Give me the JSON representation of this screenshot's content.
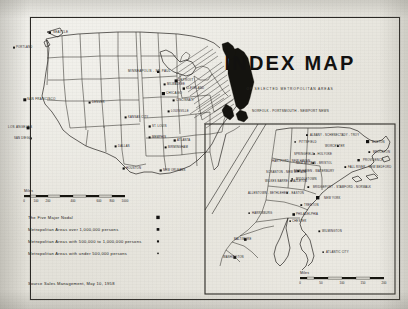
{
  "document": {
    "title": "INDEX MAP",
    "subtitle": "OF SELECTED METROPOLITAN AREAS",
    "source": "Source   Sales Management, May 10, 1958"
  },
  "legend": {
    "items": [
      {
        "label": "The Five Major Nodal",
        "marker": "square-xlarge"
      },
      {
        "label": "Metropolitan Areas over 1,000,000 persons",
        "marker": "square-large"
      },
      {
        "label": "Metropolitan Areas with  500,000 to 1,000,000 persons",
        "marker": "square-medium"
      },
      {
        "label": "Metropolitan Areas with under 500,000 persons",
        "marker": "square-small"
      }
    ]
  },
  "main_map": {
    "scale": {
      "label": "Miles",
      "ticks": [
        "0",
        "100",
        "200",
        "400",
        "600",
        "800",
        "1000"
      ]
    },
    "cities": [
      {
        "name": "SEATTLE",
        "x": 53,
        "y": 33,
        "anchor": "start",
        "size": 3
      },
      {
        "name": "PORTLAND",
        "x": 16,
        "y": 48,
        "anchor": "start",
        "size": 2
      },
      {
        "name": "SAN FRANCISCO",
        "x": 27,
        "y": 100,
        "anchor": "start",
        "size": 3
      },
      {
        "name": "LOS ANGELES",
        "x": 8,
        "y": 128,
        "anchor": "start",
        "size": 3
      },
      {
        "name": "SAN DIEGO",
        "x": 14,
        "y": 139,
        "anchor": "start",
        "size": 2
      },
      {
        "name": "DENVER",
        "x": 92,
        "y": 103,
        "anchor": "start",
        "size": 2
      },
      {
        "name": "MINNEAPOLIS - ST. PAUL",
        "x": 128,
        "y": 72,
        "anchor": "start",
        "size": 3
      },
      {
        "name": "MILWAUKEE",
        "x": 167,
        "y": 85,
        "anchor": "start",
        "size": 2
      },
      {
        "name": "CHICAGO",
        "x": 166,
        "y": 94,
        "anchor": "start",
        "size": 3
      },
      {
        "name": "KANSAS CITY",
        "x": 128,
        "y": 118,
        "anchor": "start",
        "size": 2
      },
      {
        "name": "ST. LOUIS",
        "x": 152,
        "y": 127,
        "anchor": "start",
        "size": 2
      },
      {
        "name": "DETROIT",
        "x": 178,
        "y": 81,
        "anchor": "start",
        "size": 3
      },
      {
        "name": "CLEVELAND",
        "x": 186,
        "y": 89,
        "anchor": "start",
        "size": 2
      },
      {
        "name": "CINCINNATI",
        "x": 176,
        "y": 101,
        "anchor": "start",
        "size": 2
      },
      {
        "name": "DALLAS",
        "x": 118,
        "y": 147,
        "anchor": "start",
        "size": 2
      },
      {
        "name": "HOUSTON",
        "x": 126,
        "y": 169,
        "anchor": "start",
        "size": 2
      },
      {
        "name": "NEW ORLEANS",
        "x": 163,
        "y": 171,
        "anchor": "start",
        "size": 2
      },
      {
        "name": "BIRMINGHAM",
        "x": 168,
        "y": 148,
        "anchor": "start",
        "size": 2
      },
      {
        "name": "ATLANTA",
        "x": 177,
        "y": 141,
        "anchor": "start",
        "size": 2
      },
      {
        "name": "MEMPHIS",
        "x": 152,
        "y": 138,
        "anchor": "start",
        "size": 2
      },
      {
        "name": "LOUISVILLE",
        "x": 171,
        "y": 112,
        "anchor": "start",
        "size": 2
      },
      {
        "name": "NORFOLK - PORTSMOUTH - NEWPORT NEWS",
        "x": 252,
        "y": 112,
        "anchor": "start",
        "size": 3
      }
    ]
  },
  "inset_map": {
    "scale": {
      "label": "Miles",
      "ticks": [
        "0",
        "50",
        "100",
        "150",
        "200"
      ]
    },
    "cities": [
      {
        "name": "ALBANY - SCHENECTADY - TROY",
        "x": 310,
        "y": 136
      },
      {
        "name": "PITTSFIELD",
        "x": 299,
        "y": 143
      },
      {
        "name": "WORCESTER",
        "x": 325,
        "y": 147
      },
      {
        "name": "BOSTON",
        "x": 372,
        "y": 143
      },
      {
        "name": "BROCKTON",
        "x": 373,
        "y": 153
      },
      {
        "name": "SPRINGFIELD - HOLYOKE",
        "x": 294,
        "y": 155
      },
      {
        "name": "PROVIDENCE",
        "x": 363,
        "y": 161
      },
      {
        "name": "NEW BRITAIN - BRISTOL",
        "x": 296,
        "y": 164
      },
      {
        "name": "FALL RIVER - NEW BEDFORD",
        "x": 348,
        "y": 168
      },
      {
        "name": "HARTFORD - NEW HAVEN",
        "x": 272,
        "y": 162
      },
      {
        "name": "NEW HAVEN - WATERBURY",
        "x": 294,
        "y": 172
      },
      {
        "name": "SCRANTON - NEW BRITAIN",
        "x": 266,
        "y": 173
      },
      {
        "name": "MIDDLETOWN",
        "x": 296,
        "y": 180
      },
      {
        "name": "WILKES BARRE - HAZLETON",
        "x": 265,
        "y": 182
      },
      {
        "name": "BRIDGEPORT - STAMFORD - NORWALK",
        "x": 313,
        "y": 188
      },
      {
        "name": "ALLENTOWN - BETHLEHEM - EASTON",
        "x": 248,
        "y": 194
      },
      {
        "name": "NEW YORK",
        "x": 324,
        "y": 199
      },
      {
        "name": "TRENTON",
        "x": 304,
        "y": 206
      },
      {
        "name": "HARRISBURG",
        "x": 252,
        "y": 214
      },
      {
        "name": "PHILADELPHIA",
        "x": 296,
        "y": 215
      },
      {
        "name": "CHESTER",
        "x": 292,
        "y": 222
      },
      {
        "name": "WILMINGTON",
        "x": 322,
        "y": 232
      },
      {
        "name": "BALTIMORE",
        "x": 234,
        "y": 240
      },
      {
        "name": "ATLANTIC CITY",
        "x": 326,
        "y": 253
      },
      {
        "name": "WASHINGTON",
        "x": 223,
        "y": 258
      }
    ]
  }
}
